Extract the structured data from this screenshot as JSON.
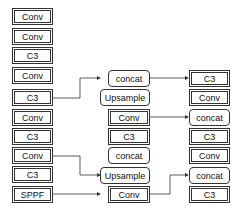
{
  "backbone": [
    "Conv",
    "Conv",
    "C3",
    "Conv",
    "C3",
    "Conv",
    "C3",
    "Conv",
    "C3",
    "SPPF"
  ],
  "neck": [
    "concat",
    "Upsample",
    "Conv",
    "C3",
    "concat",
    "Upsample",
    "Conv"
  ],
  "head": [
    "C3",
    "Conv",
    "concat",
    "C3",
    "Conv",
    "concat",
    "C3"
  ],
  "colors": {
    "line": "#333333",
    "bg": "#ffffff"
  }
}
